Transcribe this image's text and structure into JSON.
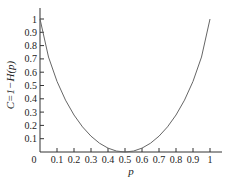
{
  "chart_data": {
    "type": "line",
    "title": "",
    "xlabel": "p",
    "ylabel": "C=1−H(p)",
    "xlim": [
      0,
      1
    ],
    "ylim": [
      0,
      1
    ],
    "x_ticks": [
      "0",
      "0.1",
      "0.2",
      "0.3",
      "0.4",
      "0.5",
      "0.6",
      "0.7",
      "0.8",
      "0.9",
      "1"
    ],
    "y_ticks": [
      "0.1",
      "0.2",
      "0.3",
      "0.4",
      "0.5",
      "0.6",
      "0.7",
      "0.8",
      "0.9",
      "1"
    ],
    "grid": false,
    "legend": null,
    "series": [
      {
        "name": "C=1-H(p)",
        "x": [
          0.0,
          0.05,
          0.1,
          0.15,
          0.2,
          0.25,
          0.3,
          0.35,
          0.4,
          0.45,
          0.5,
          0.55,
          0.6,
          0.65,
          0.7,
          0.75,
          0.8,
          0.85,
          0.9,
          0.95,
          1.0
        ],
        "values": [
          1.0,
          0.714,
          0.531,
          0.39,
          0.278,
          0.189,
          0.119,
          0.066,
          0.029,
          0.007,
          0.0,
          0.007,
          0.029,
          0.066,
          0.119,
          0.189,
          0.278,
          0.39,
          0.531,
          0.714,
          1.0
        ]
      }
    ]
  }
}
